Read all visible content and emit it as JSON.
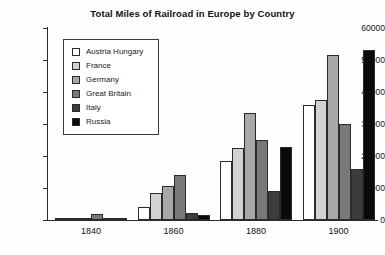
{
  "chart_data": {
    "type": "bar",
    "title": "Total Miles of Railroad in Europe by Country",
    "xlabel": "",
    "ylabel": "",
    "categories": [
      "1840",
      "1860",
      "1880",
      "1900"
    ],
    "ylim": [
      0,
      60000
    ],
    "yticks": [
      0,
      10000,
      20000,
      30000,
      40000,
      50000,
      60000
    ],
    "ytick_labels": [
      "0",
      "10000",
      "20000",
      "30000",
      "40000",
      "50000",
      "60000"
    ],
    "grid": false,
    "legend_position": "upper-left-inside",
    "series": [
      {
        "name": "Austria Hungary",
        "color": "#ffffff",
        "values": [
          150,
          4000,
          18500,
          36000
        ]
      },
      {
        "name": "France",
        "color": "#d2d2d2",
        "values": [
          500,
          8500,
          22500,
          37500
        ]
      },
      {
        "name": "Germany",
        "color": "#a8a8a8",
        "values": [
          300,
          10500,
          33500,
          51500
        ]
      },
      {
        "name": "Great Britain",
        "color": "#787878",
        "values": [
          2000,
          14000,
          25000,
          30000
        ]
      },
      {
        "name": "Italy",
        "color": "#3c3c3c",
        "values": [
          100,
          2200,
          9000,
          16000
        ]
      },
      {
        "name": "Russia",
        "color": "#0a0a0a",
        "values": [
          200,
          1500,
          22800,
          53000
        ]
      }
    ]
  },
  "legend": {
    "items": [
      {
        "label": "Austria Hungary"
      },
      {
        "label": "France"
      },
      {
        "label": "Germany"
      },
      {
        "label": "Great Britain"
      },
      {
        "label": "Italy"
      },
      {
        "label": "Russia"
      }
    ]
  }
}
